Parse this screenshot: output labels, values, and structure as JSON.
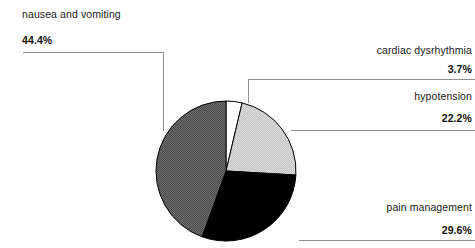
{
  "chart_data": {
    "type": "pie",
    "title": "",
    "categories": [
      "nausea and vomiting",
      "cardiac dysrhythmia",
      "hypotension",
      "pain management"
    ],
    "values": [
      44.4,
      3.7,
      22.2,
      29.6
    ],
    "value_labels": [
      "44.4%",
      "3.7%",
      "22.2%",
      "29.6%"
    ],
    "unit": "%",
    "start_angle_deg": 0,
    "direction": "clockwise",
    "legend": "none",
    "grid": false,
    "slices": [
      {
        "name": "cardiac dysrhythmia",
        "label": "cardiac dysrhythmia",
        "percent_label": "3.7%",
        "value": 3.7,
        "color": "#ffffff",
        "stroke": "#000000"
      },
      {
        "name": "hypotension",
        "label": "hypotension",
        "percent_label": "22.2%",
        "value": 22.2,
        "color": "#d2d2d2",
        "stroke": "#000000"
      },
      {
        "name": "pain management",
        "label": "pain management",
        "percent_label": "29.6%",
        "value": 29.6,
        "color": "#000000",
        "stroke": "#000000"
      },
      {
        "name": "nausea and vomiting",
        "label": "nausea and vomiting",
        "percent_label": "44.4%",
        "value": 44.4,
        "color": "#595959",
        "stroke": "#000000"
      }
    ]
  },
  "labels": {
    "nausea": {
      "text": "nausea and vomiting",
      "percent": "44.4%"
    },
    "cardiac": {
      "text": "cardiac dysrhythmia",
      "percent": "3.7%"
    },
    "hypotension": {
      "text": "hypotension",
      "percent": "22.2%"
    },
    "pain": {
      "text": "pain management",
      "percent": "29.6%"
    }
  },
  "colors": {
    "background": "#ffffff",
    "text": "#1a1a1a",
    "leader_line": "#8f8f8f",
    "slice_outline": "#000000",
    "slice_dark_gray": "#595959",
    "slice_light_gray": "#d2d2d2",
    "slice_black": "#000000",
    "slice_white": "#ffffff"
  }
}
